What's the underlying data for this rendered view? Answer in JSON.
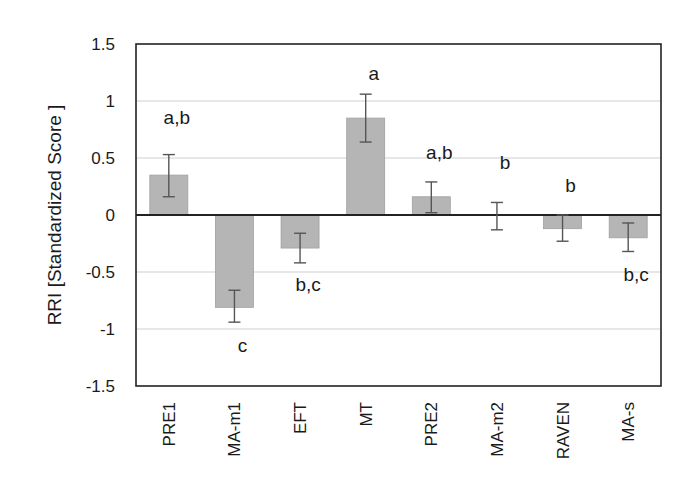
{
  "chart_data": {
    "type": "bar",
    "title": "",
    "xlabel": "",
    "ylabel": "RRI [Standardized Score ]",
    "ylim": [
      -1.5,
      1.5
    ],
    "yticks": [
      1.5,
      1,
      0.5,
      0,
      -0.5,
      -1,
      -1.5
    ],
    "ytick_labels": [
      "1.5",
      "1",
      "0.5",
      "0",
      "-0.5",
      "-1",
      "-1.5"
    ],
    "grid": true,
    "legend": null,
    "categories": [
      "PRE1",
      "MA-m1",
      "EFT",
      "MT",
      "PRE2",
      "MA-m2",
      "RAVEN",
      "MA-s"
    ],
    "values": [
      0.35,
      -0.81,
      -0.29,
      0.85,
      0.16,
      0.0,
      -0.12,
      -0.2
    ],
    "error_low": [
      0.16,
      -0.94,
      -0.42,
      0.64,
      0.02,
      -0.13,
      -0.23,
      -0.32
    ],
    "error_high": [
      0.53,
      -0.66,
      -0.16,
      1.06,
      0.29,
      0.11,
      0.0,
      -0.07
    ],
    "annotations": [
      "a,b",
      "c",
      "b,c",
      "a",
      "a,b",
      "b",
      "b",
      "b,c"
    ],
    "annotation_position": [
      "above",
      "below",
      "below",
      "above",
      "above",
      "above",
      "above",
      "below"
    ],
    "bar_color": "#b5b5b5",
    "bar_edge_color": "#a0a0a0",
    "error_bar_color": "#555555",
    "gridline_color": "#cfcfcf",
    "axis_color": "#222222"
  }
}
